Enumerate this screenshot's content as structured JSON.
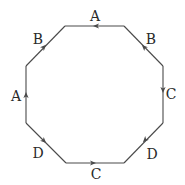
{
  "diagram": {
    "vertices": [
      {
        "id": "v0",
        "x": 65,
        "y": 26
      },
      {
        "id": "v1",
        "x": 124,
        "y": 26
      },
      {
        "id": "v2",
        "x": 163,
        "y": 66
      },
      {
        "id": "v3",
        "x": 163,
        "y": 123
      },
      {
        "id": "v4",
        "x": 124,
        "y": 163
      },
      {
        "id": "v5",
        "x": 66,
        "y": 163
      },
      {
        "id": "v6",
        "x": 26,
        "y": 123
      },
      {
        "id": "v7",
        "x": 26,
        "y": 66
      }
    ],
    "edges": [
      {
        "position": "top",
        "label": "A",
        "direction": "left"
      },
      {
        "position": "upper-right",
        "label": "B",
        "direction": "up-left"
      },
      {
        "position": "right",
        "label": "C",
        "direction": "down"
      },
      {
        "position": "lower-right",
        "label": "D",
        "direction": "down-left"
      },
      {
        "position": "bottom",
        "label": "C",
        "direction": "right"
      },
      {
        "position": "lower-left",
        "label": "D",
        "direction": "down-right"
      },
      {
        "position": "left",
        "label": "A",
        "direction": "up"
      },
      {
        "position": "upper-left",
        "label": "B",
        "direction": "up-right"
      }
    ],
    "colors": {
      "edge": "#4a4a4a",
      "label": "#2a2a2a",
      "background": "#ffffff"
    }
  }
}
